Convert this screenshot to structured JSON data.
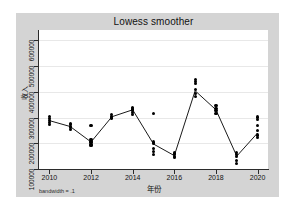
{
  "chart_data": {
    "type": "scatter",
    "title": "Lowess smoother",
    "xlabel": "年份",
    "ylabel": "收入",
    "annotation": "bandwidth = .1",
    "grid": true,
    "legend": false,
    "xlim": [
      2009.5,
      2020.5
    ],
    "ylim": [
      100000,
      640000
    ],
    "xticks": [
      "2010",
      "2012",
      "2014",
      "2016",
      "2018",
      "2020"
    ],
    "xtick_values": [
      2010,
      2012,
      2014,
      2016,
      2018,
      2020
    ],
    "yticks": [
      "100000",
      "200000",
      "300000",
      "400000",
      "500000",
      "600000"
    ],
    "ytick_values": [
      100000,
      200000,
      300000,
      400000,
      500000,
      600000
    ],
    "marker_color": "#000000",
    "line_color": "#000000",
    "series": [
      {
        "name": "收入",
        "points": [
          {
            "x": 2010,
            "y": 305000
          },
          {
            "x": 2010,
            "y": 297000
          },
          {
            "x": 2010,
            "y": 288000
          },
          {
            "x": 2010,
            "y": 281000
          },
          {
            "x": 2010,
            "y": 272000
          },
          {
            "x": 2011,
            "y": 278000
          },
          {
            "x": 2011,
            "y": 272000
          },
          {
            "x": 2011,
            "y": 266000
          },
          {
            "x": 2011,
            "y": 260000
          },
          {
            "x": 2011,
            "y": 253000
          },
          {
            "x": 2012,
            "y": 215000
          },
          {
            "x": 2012,
            "y": 208000
          },
          {
            "x": 2012,
            "y": 202000
          },
          {
            "x": 2012,
            "y": 196000
          },
          {
            "x": 2012,
            "y": 190000
          },
          {
            "x": 2012,
            "y": 268000
          },
          {
            "x": 2013,
            "y": 310000
          },
          {
            "x": 2013,
            "y": 304000
          },
          {
            "x": 2013,
            "y": 298000
          },
          {
            "x": 2014,
            "y": 340000
          },
          {
            "x": 2014,
            "y": 333000
          },
          {
            "x": 2014,
            "y": 326000
          },
          {
            "x": 2014,
            "y": 319000
          },
          {
            "x": 2014,
            "y": 312000
          },
          {
            "x": 2015,
            "y": 205000
          },
          {
            "x": 2015,
            "y": 198000
          },
          {
            "x": 2015,
            "y": 180000
          },
          {
            "x": 2015,
            "y": 168000
          },
          {
            "x": 2015,
            "y": 155000
          },
          {
            "x": 2015,
            "y": 317000
          },
          {
            "x": 2016,
            "y": 162000
          },
          {
            "x": 2016,
            "y": 156000
          },
          {
            "x": 2016,
            "y": 150000
          },
          {
            "x": 2016,
            "y": 145000
          },
          {
            "x": 2017,
            "y": 448000
          },
          {
            "x": 2017,
            "y": 440000
          },
          {
            "x": 2017,
            "y": 432000
          },
          {
            "x": 2017,
            "y": 410000
          },
          {
            "x": 2017,
            "y": 392000
          },
          {
            "x": 2017,
            "y": 382000
          },
          {
            "x": 2018,
            "y": 345000
          },
          {
            "x": 2018,
            "y": 336000
          },
          {
            "x": 2018,
            "y": 328000
          },
          {
            "x": 2018,
            "y": 316000
          },
          {
            "x": 2019,
            "y": 165000
          },
          {
            "x": 2019,
            "y": 157000
          },
          {
            "x": 2019,
            "y": 148000
          },
          {
            "x": 2019,
            "y": 133000
          },
          {
            "x": 2019,
            "y": 122000
          },
          {
            "x": 2020,
            "y": 302000
          },
          {
            "x": 2020,
            "y": 294000
          },
          {
            "x": 2020,
            "y": 268000
          },
          {
            "x": 2020,
            "y": 248000
          },
          {
            "x": 2020,
            "y": 232000
          },
          {
            "x": 2020,
            "y": 224000
          }
        ]
      }
    ],
    "smoother": {
      "name": "lowess",
      "points": [
        {
          "x": 2010,
          "y": 288000
        },
        {
          "x": 2011,
          "y": 265000
        },
        {
          "x": 2012,
          "y": 205000
        },
        {
          "x": 2013,
          "y": 303000
        },
        {
          "x": 2014,
          "y": 330000
        },
        {
          "x": 2015,
          "y": 197000
        },
        {
          "x": 2016,
          "y": 152000
        },
        {
          "x": 2017,
          "y": 404000
        },
        {
          "x": 2018,
          "y": 330000
        },
        {
          "x": 2019,
          "y": 150000
        },
        {
          "x": 2020,
          "y": 240000
        }
      ]
    }
  }
}
